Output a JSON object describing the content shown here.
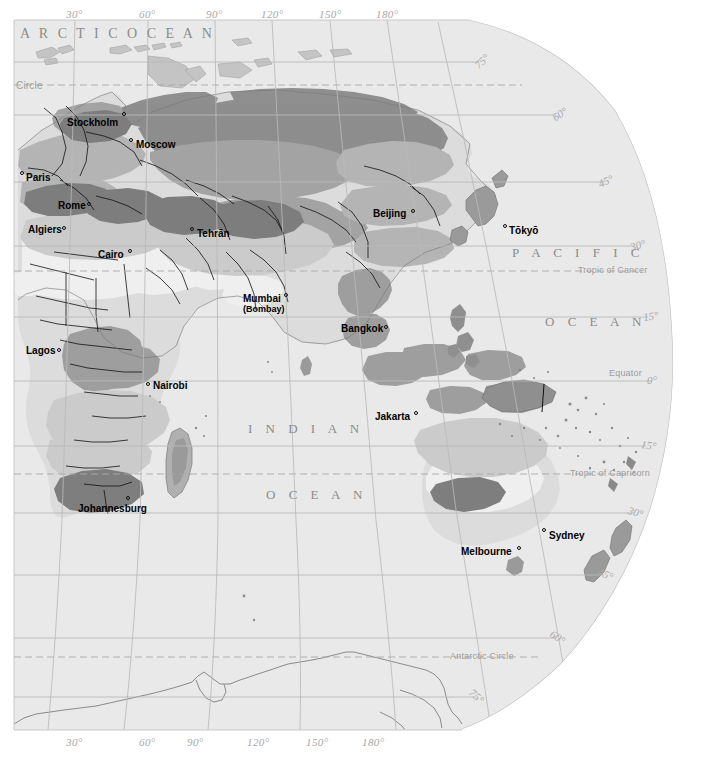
{
  "map": {
    "title": "World climate map (Eastern Hemisphere)",
    "projection": "globe-edge",
    "ocean_fill": "#e9e9e9",
    "land_base": "#e2e2e2",
    "graticule_color": "#b9b9b9",
    "border_color": "#1a1a1a",
    "coast_color": "#8f8f8f"
  },
  "axes": {
    "top_longitudes": [
      {
        "label": "30°",
        "x": 75
      },
      {
        "label": "60°",
        "x": 148
      },
      {
        "label": "90°",
        "x": 215
      },
      {
        "label": "120°",
        "x": 272
      },
      {
        "label": "150°",
        "x": 330
      },
      {
        "label": "180°",
        "x": 387
      }
    ],
    "bottom_longitudes": [
      {
        "label": "30°",
        "x": 75
      },
      {
        "label": "60°",
        "x": 148
      },
      {
        "label": "90°",
        "x": 196
      },
      {
        "label": "120°",
        "x": 258
      },
      {
        "label": "150°",
        "x": 317
      },
      {
        "label": "180°",
        "x": 373
      }
    ],
    "latitudes": [
      {
        "label": "75°",
        "x": 478,
        "y": 62
      },
      {
        "label": "60°",
        "x": 556,
        "y": 115
      },
      {
        "label": "45°",
        "x": 602,
        "y": 182
      },
      {
        "label": "30°",
        "x": 632,
        "y": 246
      },
      {
        "label": "15°",
        "x": 645,
        "y": 317
      },
      {
        "label": "0°",
        "x": 648,
        "y": 381
      },
      {
        "label": "15°",
        "x": 643,
        "y": 446
      },
      {
        "label": "30°",
        "x": 630,
        "y": 513
      },
      {
        "label": "45°",
        "x": 600,
        "y": 575
      },
      {
        "label": "60°",
        "x": 553,
        "y": 638
      },
      {
        "label": "75°",
        "x": 472,
        "y": 697
      }
    ]
  },
  "ocean_labels": [
    {
      "text": "A R C T I C   O C E A N",
      "x": 20,
      "y": 30,
      "spacing": 3,
      "size": 14
    },
    {
      "text": "P A C I F I C",
      "x": 512,
      "y": 251,
      "spacing": 5,
      "size": 13
    },
    {
      "text": "O C E A N",
      "x": 545,
      "y": 320,
      "spacing": 5,
      "size": 13
    },
    {
      "text": "I N D I A N",
      "x": 248,
      "y": 427,
      "spacing": 5,
      "size": 13
    },
    {
      "text": "O C E A N",
      "x": 266,
      "y": 493,
      "spacing": 5,
      "size": 13
    }
  ],
  "reference_lines": [
    {
      "label": "Circle",
      "x": 18,
      "y": 85,
      "note": "Arctic Circle (clipped at left edge)"
    },
    {
      "label": "Tropic of Cancer",
      "x": 578,
      "y": 271
    },
    {
      "label": "Equator",
      "x": 636,
      "y": 373
    },
    {
      "label": "Tropic of Capricorn",
      "x": 570,
      "y": 474
    },
    {
      "label": "Antarctic Circle",
      "x": 450,
      "y": 657
    }
  ],
  "cities": [
    {
      "name": "Stockholm",
      "x": 67,
      "y": 117,
      "dot_x": 123,
      "dot_y": 112,
      "dot_side": "right"
    },
    {
      "name": "Moscow",
      "x": 136,
      "y": 139,
      "dot_x": 131,
      "dot_y": 137,
      "dot_side": "left"
    },
    {
      "name": "Paris",
      "x": 26,
      "y": 172,
      "dot_x": 22,
      "dot_y": 170,
      "dot_side": "left"
    },
    {
      "name": "Rome",
      "x": 59,
      "y": 200,
      "dot_x": 87,
      "dot_y": 199,
      "dot_side": "right"
    },
    {
      "name": "Algiers",
      "x": 29,
      "y": 224,
      "dot_x": 62,
      "dot_y": 223,
      "dot_side": "right"
    },
    {
      "name": "Cairo",
      "x": 99,
      "y": 249,
      "dot_x": 128,
      "dot_y": 248,
      "dot_side": "right"
    },
    {
      "name": "Tehrān",
      "x": 196,
      "y": 228,
      "dot_x": 192,
      "dot_y": 226,
      "dot_side": "left"
    },
    {
      "name": "Beijing",
      "x": 373,
      "y": 208,
      "dot_x": 411,
      "dot_y": 208,
      "dot_side": "right"
    },
    {
      "name": "Tōkyō",
      "x": 508,
      "y": 225,
      "dot_x": 504,
      "dot_y": 223,
      "dot_side": "left"
    },
    {
      "name": "Mumbai",
      "x": 243,
      "y": 294,
      "alt": "(Bombay)",
      "dot_x": 283,
      "dot_y": 293,
      "dot_side": "right"
    },
    {
      "name": "Bangkok",
      "x": 341,
      "y": 323,
      "dot_x": 383,
      "dot_y": 324,
      "dot_side": "right"
    },
    {
      "name": "Lagos",
      "x": 26,
      "y": 345,
      "dot_x": 56,
      "dot_y": 347,
      "dot_side": "right"
    },
    {
      "name": "Nairobi",
      "x": 152,
      "y": 380,
      "dot_x": 147,
      "dot_y": 381,
      "dot_side": "left"
    },
    {
      "name": "Jakarta",
      "x": 375,
      "y": 411,
      "dot_x": 414,
      "dot_y": 410,
      "dot_side": "right"
    },
    {
      "name": "Johannesburg",
      "x": 78,
      "y": 503,
      "dot_x": 127,
      "dot_y": 496,
      "dot_side": "top"
    },
    {
      "name": "Sydney",
      "x": 548,
      "y": 530,
      "dot_x": 543,
      "dot_y": 527,
      "dot_side": "left"
    },
    {
      "name": "Melbourne",
      "x": 461,
      "y": 546,
      "dot_x": 516,
      "dot_y": 545,
      "dot_side": "right"
    }
  ]
}
